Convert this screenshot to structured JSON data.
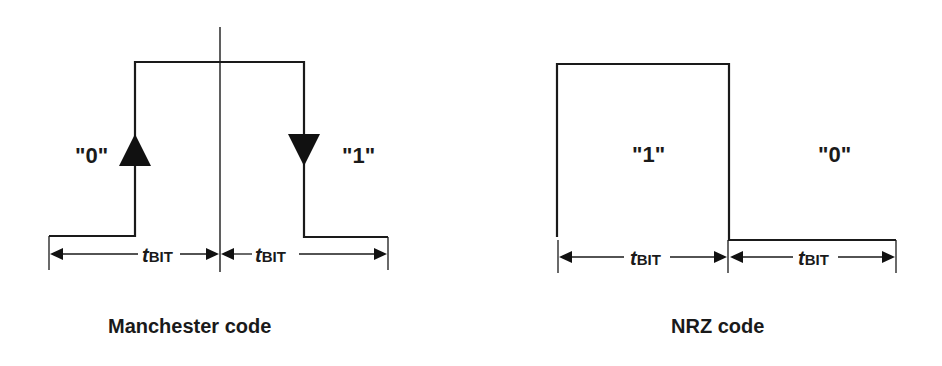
{
  "diagrams": [
    {
      "id": "manchester",
      "caption": "Manchester code",
      "bit_labels": [
        "\"0\"",
        "\"1\""
      ],
      "transitions": [
        "rising-edge-arrow",
        "falling-edge-arrow"
      ],
      "dimension_labels": [
        {
          "main": "t",
          "sub": "BIT"
        },
        {
          "main": "t",
          "sub": "BIT"
        }
      ]
    },
    {
      "id": "nrz",
      "caption": "NRZ code",
      "bit_labels": [
        "\"1\"",
        "\"0\""
      ],
      "dimension_labels": [
        {
          "main": "t",
          "sub": "BIT"
        },
        {
          "main": "t",
          "sub": "BIT"
        }
      ]
    }
  ],
  "colors": {
    "line": "#1a1a1a",
    "background": "#ffffff"
  }
}
